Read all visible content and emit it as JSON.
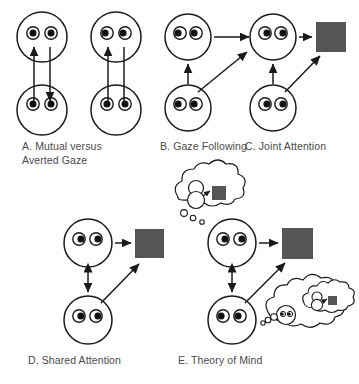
{
  "figure": {
    "stroke_color": "#1a1a1a",
    "object_color": "#555555",
    "background_color": "#ffffff",
    "text_color": "#4a4a4a"
  },
  "panels": [
    {
      "id": "A",
      "caption": "A. Mutual versus\nAverted Gaze",
      "label": "A.",
      "name": "Mutual versus Averted Gaze",
      "faces": [
        {
          "role": "mutual-top",
          "gaze": "direct",
          "pupils": "center"
        },
        {
          "role": "mutual-bottom",
          "gaze": "direct",
          "pupils": "center"
        },
        {
          "role": "averted-top",
          "gaze": "averted",
          "pupils": "left"
        },
        {
          "role": "averted-bottom",
          "gaze": "direct",
          "pupils": "center"
        }
      ],
      "arrows": [
        {
          "from": "mutual-bottom",
          "to": "mutual-top",
          "heads": "both"
        },
        {
          "from": "averted-bottom",
          "to": "averted-top",
          "heads": "none"
        }
      ],
      "objects": []
    },
    {
      "id": "B",
      "caption": "B. Gaze Following",
      "label": "B.",
      "name": "Gaze Following",
      "faces": [
        {
          "role": "top",
          "gaze": "averted",
          "pupils": "left"
        },
        {
          "role": "bottom",
          "gaze": "direct",
          "pupils": "center"
        }
      ],
      "arrows": [
        {
          "from": "top",
          "to": "right",
          "heads": "single"
        },
        {
          "from": "bottom",
          "to": "top",
          "heads": "single"
        },
        {
          "from": "bottom",
          "to": "upper-right",
          "heads": "single"
        }
      ],
      "objects": []
    },
    {
      "id": "C",
      "caption": "C. Joint Attention",
      "label": "C.",
      "name": "Joint Attention",
      "faces": [
        {
          "role": "top",
          "gaze": "averted",
          "pupils": "right"
        },
        {
          "role": "bottom",
          "gaze": "direct",
          "pupils": "center"
        }
      ],
      "arrows": [
        {
          "from": "top",
          "to": "object",
          "heads": "single"
        },
        {
          "from": "bottom",
          "to": "top",
          "heads": "single"
        },
        {
          "from": "bottom",
          "to": "object",
          "heads": "single"
        }
      ],
      "objects": [
        {
          "role": "target-square",
          "shape": "square",
          "color": "#555555"
        }
      ]
    },
    {
      "id": "D",
      "caption": "D. Shared Attention",
      "label": "D.",
      "name": "Shared Attention",
      "faces": [
        {
          "role": "top",
          "gaze": "averted",
          "pupils": "right"
        },
        {
          "role": "bottom",
          "gaze": "averted",
          "pupils": "right"
        }
      ],
      "arrows": [
        {
          "from": "top",
          "to": "object",
          "heads": "single"
        },
        {
          "from": "bottom",
          "to": "top",
          "heads": "both"
        },
        {
          "from": "bottom",
          "to": "object",
          "heads": "single"
        }
      ],
      "objects": [
        {
          "role": "target-square",
          "shape": "square",
          "color": "#555555"
        }
      ]
    },
    {
      "id": "E",
      "caption": "E. Theory of Mind",
      "label": "E.",
      "name": "Theory of Mind",
      "faces": [
        {
          "role": "top",
          "gaze": "averted",
          "pupils": "right"
        },
        {
          "role": "bottom",
          "gaze": "averted",
          "pupils": "left"
        }
      ],
      "arrows": [
        {
          "from": "top",
          "to": "object",
          "heads": "single"
        },
        {
          "from": "bottom",
          "to": "top",
          "heads": "both"
        },
        {
          "from": "bottom",
          "to": "object",
          "heads": "single"
        }
      ],
      "objects": [
        {
          "role": "target-square",
          "shape": "square",
          "color": "#555555"
        }
      ],
      "thought_bubbles": [
        {
          "role": "top-face-thought",
          "owner": "top",
          "contents": "mini-face attending to mini-square",
          "nested_bubble": false
        },
        {
          "role": "bottom-face-thought",
          "owner": "bottom",
          "contents": "mini-face with its own nested thought of a face attending to a square",
          "nested_bubble": true
        }
      ]
    }
  ]
}
